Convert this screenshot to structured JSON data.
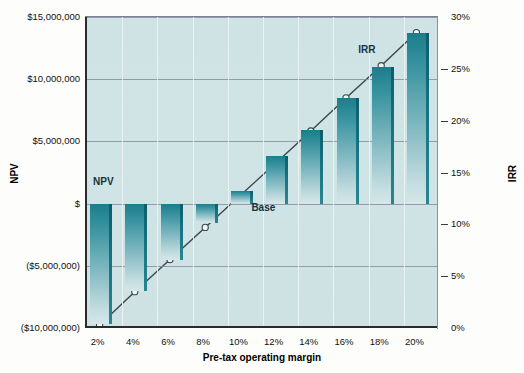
{
  "chart_data": {
    "type": "bar",
    "title": "",
    "xlabel": "Pre-tax operating margin",
    "ylabel": "NPV",
    "y2label": "IRR",
    "categories": [
      "2%",
      "4%",
      "6%",
      "8%",
      "10%",
      "12%",
      "14%",
      "16%",
      "18%",
      "20%"
    ],
    "x_values": [
      2,
      4,
      6,
      8,
      10,
      12,
      14,
      16,
      18,
      20
    ],
    "ylim": [
      -10000000,
      15000000
    ],
    "y_ticks": [
      15000000,
      10000000,
      5000000,
      0,
      -5000000,
      -10000000
    ],
    "y_tick_labels": [
      "$15,000,000",
      "$10,000,000",
      "$5,000,000",
      "$",
      "($5,000,000)",
      "($10,000,000)"
    ],
    "y2lim": [
      0,
      30
    ],
    "y2_ticks": [
      30,
      25,
      20,
      15,
      10,
      5,
      0
    ],
    "y2_tick_labels": [
      "30%",
      "25%",
      "20%",
      "15%",
      "10%",
      "5%",
      "0%"
    ],
    "grid": true,
    "legend": "inline-annotations",
    "series": [
      {
        "name": "NPV",
        "type": "bar",
        "axis": "left",
        "values": [
          -9700000,
          -7000000,
          -4500000,
          -1600000,
          1000000,
          3800000,
          5900000,
          8500000,
          11000000,
          13700000
        ]
      },
      {
        "name": "IRR",
        "type": "line",
        "axis": "right",
        "marker": "open-circle",
        "values": [
          0.3,
          3.5,
          6.6,
          9.7,
          12.8,
          15.9,
          19.0,
          22.2,
          25.3,
          28.5
        ]
      }
    ],
    "annotations": [
      {
        "text": "NPV",
        "x_category": "2%",
        "note": "label for bar series, upper-left of plot"
      },
      {
        "text": "Base",
        "x_category": "10%",
        "note": "label marking the base case column"
      },
      {
        "text": "IRR",
        "x_category": "18%",
        "note": "label for line series, upper-right of plot"
      }
    ]
  },
  "colors": {
    "plot_background": "#cfe3e4",
    "bar_top": "#1b7d8c",
    "bar_bottom": "#d6e7e8",
    "bar_edge": "#0d5d6c",
    "gridline": "#7f8296",
    "axis": "#2b2b2b",
    "line": "#3a4450",
    "page_background": "#fdfdfb"
  }
}
